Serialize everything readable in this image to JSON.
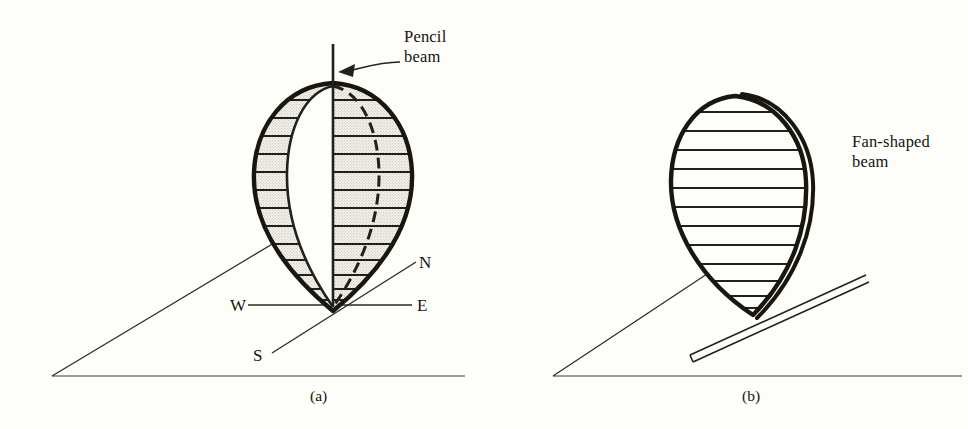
{
  "figure": {
    "background_color": "#fdfdfa",
    "ink_color": "#15130f",
    "stipple_color": "#ebeae4",
    "panels": [
      {
        "id": "a",
        "caption": "(a)",
        "beam_type": "pencil",
        "label": "Pencil\nbeam",
        "lobe_fill": "stippled",
        "hatch_lines": 13,
        "has_inner_lobe": true,
        "has_dashed_back_edge": true,
        "compass": {
          "north": "N",
          "east": "E",
          "south": "S",
          "west": "W"
        }
      },
      {
        "id": "b",
        "caption": "(b)",
        "beam_type": "fan",
        "label": "Fan-shaped\nbeam",
        "lobe_fill": "white",
        "hatch_lines": 12,
        "has_inner_lobe": false,
        "has_dashed_back_edge": false
      }
    ]
  }
}
